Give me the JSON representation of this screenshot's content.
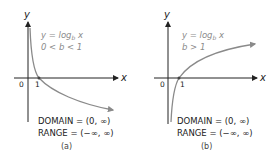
{
  "panels": [
    {
      "id": "a",
      "axis_x_label": "x",
      "axis_y_label": "y",
      "origin_label": "0",
      "tick_label": "1",
      "equation": "y = log",
      "equation_sub": "b",
      "equation_tail": " x",
      "condition": "0 < b < 1",
      "domain": "DOMAIN = (0, ∞)",
      "range": "RANGE = (−∞, ∞)",
      "caption": "(a)"
    },
    {
      "id": "b",
      "axis_x_label": "x",
      "axis_y_label": "y",
      "origin_label": "0",
      "tick_label": "1",
      "equation": "y = log",
      "equation_sub": "b",
      "equation_tail": " x",
      "condition": "b > 1",
      "domain": "DOMAIN = (0, ∞)",
      "range": "RANGE = (−∞, ∞)",
      "caption": "(b)"
    }
  ],
  "colors": {
    "axis": "#222222",
    "curve": "#8a8a8a",
    "text": "#222222",
    "label_gray": "#8a8a8a"
  }
}
